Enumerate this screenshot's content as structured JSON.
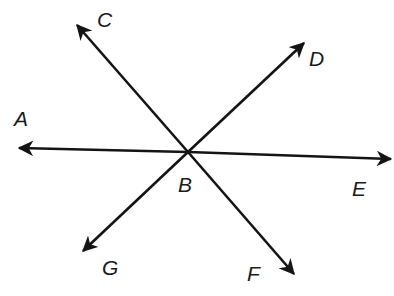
{
  "diagram": {
    "type": "intersecting-lines",
    "center": {
      "name": "B",
      "x": 188,
      "y": 152
    },
    "colors": {
      "stroke": "#141414",
      "label": "#1a1a1a",
      "background": "#ffffff"
    },
    "rays": [
      {
        "point": "A",
        "tip": [
          19,
          148
        ],
        "label_pos": [
          14,
          126
        ]
      },
      {
        "point": "C",
        "tip": [
          77,
          25
        ],
        "label_pos": [
          97,
          27
        ]
      },
      {
        "point": "D",
        "tip": [
          304,
          43
        ],
        "label_pos": [
          309,
          66
        ]
      },
      {
        "point": "E",
        "tip": [
          391,
          159
        ],
        "label_pos": [
          352,
          196
        ]
      },
      {
        "point": "F",
        "tip": [
          294,
          274
        ],
        "label_pos": [
          247,
          281
        ]
      },
      {
        "point": "G",
        "tip": [
          83,
          251
        ],
        "label_pos": [
          102,
          275
        ]
      }
    ],
    "center_label_pos": [
      178,
      192
    ],
    "lines": [
      {
        "name": "line AE",
        "through": [
          "A",
          "B",
          "E"
        ]
      },
      {
        "name": "line CF",
        "through": [
          "C",
          "B",
          "F"
        ]
      },
      {
        "name": "line DG",
        "through": [
          "D",
          "B",
          "G"
        ]
      }
    ]
  },
  "labels": {
    "A": "A",
    "B": "B",
    "C": "C",
    "D": "D",
    "E": "E",
    "F": "F",
    "G": "G"
  }
}
